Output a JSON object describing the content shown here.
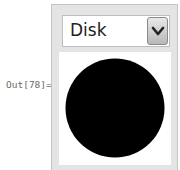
{
  "cell": {
    "output_label": "Out[78]="
  },
  "manipulate": {
    "dropdown": {
      "selected": "Disk",
      "icon": "chevron-down-icon"
    },
    "graphic": {
      "shape": "disk",
      "fill": "#000000",
      "background": "#ffffff"
    }
  }
}
